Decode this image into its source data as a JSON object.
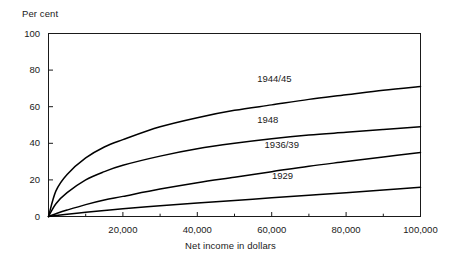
{
  "chart_data": {
    "type": "line",
    "title": "",
    "xlabel": "Net income in dollars",
    "ylabel": "Per cent",
    "xlim": [
      0,
      100000
    ],
    "ylim": [
      0,
      100
    ],
    "grid": false,
    "legend_position": "inline-right",
    "xticks": [
      {
        "value": 20000,
        "label": "20,000"
      },
      {
        "value": 40000,
        "label": "40,000"
      },
      {
        "value": 60000,
        "label": "60,000"
      },
      {
        "value": 80000,
        "label": "80,000"
      },
      {
        "value": 100000,
        "label": "100,000"
      }
    ],
    "xminor_ticks": [
      10000,
      30000,
      50000,
      70000,
      90000
    ],
    "yticks": [
      {
        "value": 0,
        "label": "0"
      },
      {
        "value": 20,
        "label": "20"
      },
      {
        "value": 40,
        "label": "40"
      },
      {
        "value": 60,
        "label": "60"
      },
      {
        "value": 80,
        "label": "80"
      },
      {
        "value": 100,
        "label": "100"
      }
    ],
    "x": [
      0,
      2000,
      5000,
      10000,
      15000,
      20000,
      30000,
      40000,
      50000,
      60000,
      70000,
      80000,
      90000,
      100000
    ],
    "series": [
      {
        "name": "1944/45",
        "label": "1944/45",
        "color": "#000000",
        "values": [
          0,
          14,
          23,
          32,
          38,
          42,
          49,
          54,
          58,
          61,
          64,
          66.5,
          69,
          71
        ]
      },
      {
        "name": "1948",
        "label": "1948",
        "color": "#000000",
        "values": [
          0,
          7,
          13,
          20,
          24.5,
          28,
          33,
          37,
          40,
          42.5,
          44.5,
          46,
          47.5,
          49
        ]
      },
      {
        "name": "1936/39",
        "label": "1936/39",
        "color": "#000000",
        "values": [
          0,
          1.5,
          3.5,
          6.5,
          9,
          11,
          15,
          18.5,
          21.5,
          24.5,
          27.5,
          30,
          32.5,
          35
        ]
      },
      {
        "name": "1929",
        "label": "1929",
        "color": "#000000",
        "values": [
          0,
          0.5,
          1.2,
          2.3,
          3.3,
          4.2,
          5.9,
          7.4,
          8.8,
          10.2,
          11.6,
          13,
          14.5,
          16
        ]
      }
    ],
    "series_label_positions": [
      {
        "name": "1944/45",
        "x": 62000,
        "y": 75
      },
      {
        "name": "1948",
        "x": 62000,
        "y": 53
      },
      {
        "name": "1936/39",
        "x": 64000,
        "y": 39
      },
      {
        "name": "1929",
        "x": 66000,
        "y": 22
      }
    ]
  },
  "frame": {
    "axis_color": "#1a1a1a"
  }
}
